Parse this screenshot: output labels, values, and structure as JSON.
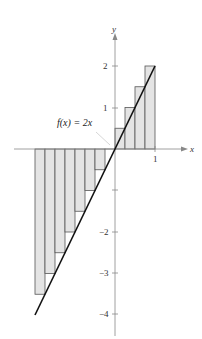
{
  "chart_data": {
    "type": "bar",
    "title": "",
    "function_label": "f(x) = 2x",
    "xlabel": "x",
    "ylabel": "y",
    "xlim": [
      -2.2,
      1.35
    ],
    "ylim": [
      -4.5,
      2.7
    ],
    "x_ticks": [
      1
    ],
    "x_tick_labels": [
      "1"
    ],
    "y_ticks": [
      -4,
      -3,
      -2,
      -1,
      1,
      2
    ],
    "y_tick_labels": [
      "-4",
      "-3",
      "-2",
      "",
      "1",
      "2"
    ],
    "grid": false,
    "line": {
      "name": "f(x) = 2x",
      "x": [
        -2,
        1
      ],
      "y": [
        -4,
        2
      ]
    },
    "rectangles": {
      "width": 0.25,
      "left_edges": [
        -2,
        -1.75,
        -1.5,
        -1.25,
        -1,
        -0.75,
        -0.5,
        -0.25,
        0,
        0.25,
        0.5,
        0.75
      ],
      "heights": [
        -3.5,
        -3,
        -2.5,
        -2,
        -1.5,
        -1,
        -0.5,
        0,
        0.5,
        1,
        1.5,
        2
      ]
    },
    "colors": {
      "fill": "#e4e4e4",
      "stroke": "#555555",
      "line": "#111111",
      "axis": "#888888"
    }
  },
  "labels": {
    "x_axis": "x",
    "y_axis": "y",
    "function": "f(x) = 2x",
    "tick_x1": "1",
    "tick_y2": "2",
    "tick_y1": "1",
    "tick_ym2": "−2",
    "tick_ym3": "−3",
    "tick_ym4": "−4"
  }
}
